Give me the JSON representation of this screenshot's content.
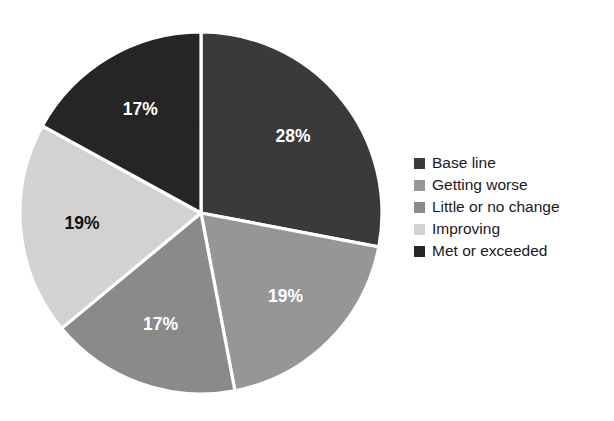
{
  "chart_data": {
    "type": "pie",
    "title": "",
    "categories": [
      "Base line",
      "Getting worse",
      "Little or no change",
      "Improving",
      "Met or exceeded"
    ],
    "values": [
      28,
      19,
      17,
      19,
      17
    ],
    "value_labels": [
      "28%",
      "19%",
      "17%",
      "19%",
      "17%"
    ],
    "unit": "percent",
    "start_angle_deg": 0,
    "direction": "clockwise",
    "legend_position": "right",
    "grid": false,
    "colors": [
      "#3a3a3a",
      "#969696",
      "#8a8a8a",
      "#d2d2d2",
      "#252525"
    ],
    "label_colors": [
      "#ffffff",
      "#ffffff",
      "#ffffff",
      "#111111",
      "#ffffff"
    ],
    "slices": [
      {
        "label": "Base line",
        "value": 28,
        "text": "28%",
        "color": "#3a3a3a",
        "label_color": "#ffffff"
      },
      {
        "label": "Getting worse",
        "value": 19,
        "text": "19%",
        "color": "#969696",
        "label_color": "#ffffff"
      },
      {
        "label": "Little or no change",
        "value": 17,
        "text": "17%",
        "color": "#8a8a8a",
        "label_color": "#ffffff"
      },
      {
        "label": "Improving",
        "value": 19,
        "text": "19%",
        "color": "#d2d2d2",
        "label_color": "#111111"
      },
      {
        "label": "Met or exceeded",
        "value": 17,
        "text": "17%",
        "color": "#252525",
        "label_color": "#ffffff"
      }
    ]
  },
  "legend": {
    "items": [
      {
        "label": "Base line",
        "color": "#3a3a3a"
      },
      {
        "label": "Getting worse",
        "color": "#969696"
      },
      {
        "label": "Little or no change",
        "color": "#8a8a8a"
      },
      {
        "label": "Improving",
        "color": "#d2d2d2"
      },
      {
        "label": "Met or exceeded",
        "color": "#252525"
      }
    ]
  }
}
